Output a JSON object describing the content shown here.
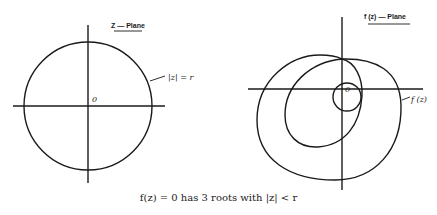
{
  "left_panel": {
    "title": "Z — Plane",
    "origin_label": "0",
    "circle_label": "|z| = r"
  },
  "right_panel": {
    "title": "f (z) — Plane",
    "origin_label": "0",
    "curve_label": "f (z)"
  },
  "caption": "f(z) = 0 has 3 roots with |z| < r",
  "colors": {
    "ink": "#1a1a1a",
    "background": "#ffffff"
  }
}
